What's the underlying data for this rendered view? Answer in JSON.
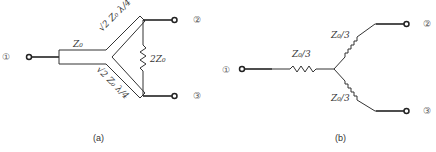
{
  "figure_a": {
    "caption": "(a)",
    "ports": {
      "p1": "①",
      "p2": "②",
      "p3": "③"
    },
    "input_line_label": "Z₀",
    "upper_arm_label": "√2 Z₀  λ/4",
    "lower_arm_label": "√2 Z₀  λ/4",
    "resistor_label": "2Z₀"
  },
  "figure_b": {
    "caption": "(b)",
    "ports": {
      "p1": "①",
      "p2": "②",
      "p3": "③"
    },
    "r1_label": "Z₀/3",
    "r2_label": "Z₀/3",
    "r3_label": "Z₀/3"
  }
}
